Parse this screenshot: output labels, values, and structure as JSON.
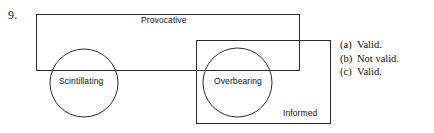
{
  "item": {
    "number": "9."
  },
  "diagram": {
    "type": "euler-diagram",
    "stroke_color": "#2b2b2b",
    "background_color": "#ffffff",
    "sets": [
      {
        "name": "Provocative",
        "shape": "rectangle",
        "label": "Provocative",
        "label_position": "top-center"
      },
      {
        "name": "Informed",
        "shape": "rectangle",
        "label": "Informed",
        "label_position": "bottom-right"
      },
      {
        "name": "Scintillating",
        "shape": "circle",
        "label": "Scintillating",
        "label_position": "center"
      },
      {
        "name": "Overbearing",
        "shape": "circle",
        "label": "Overbearing",
        "label_position": "center"
      }
    ]
  },
  "answers": [
    {
      "key": "(a)",
      "text": "Valid."
    },
    {
      "key": "(b)",
      "text": "Not valid."
    },
    {
      "key": "(c)",
      "text": "Valid."
    }
  ]
}
